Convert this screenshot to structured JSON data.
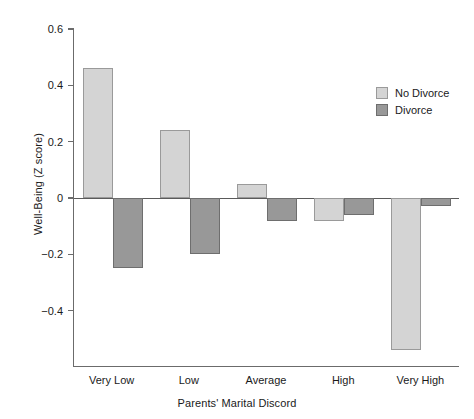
{
  "chart_data": {
    "type": "bar",
    "title": "",
    "xlabel": "Parents' Marital Discord",
    "ylabel": "Well-Being (Z score)",
    "categories": [
      "Very Low",
      "Low",
      "Average",
      "High",
      "Very High"
    ],
    "series": [
      {
        "name": "No Divorce",
        "color": "#d4d4d4",
        "values": [
          0.46,
          0.24,
          0.05,
          -0.08,
          -0.54
        ]
      },
      {
        "name": "Divorce",
        "color": "#989898",
        "values": [
          -0.25,
          -0.2,
          -0.08,
          -0.06,
          -0.03
        ]
      }
    ],
    "ylim": [
      -0.6,
      0.6
    ],
    "yticks": [
      0.6,
      0.4,
      0.2,
      0,
      -0.2,
      -0.4
    ],
    "ytick_labels": [
      "0.6",
      "0.4",
      "0.2",
      "0",
      "−0.2",
      "−0.4"
    ],
    "grid": false,
    "legend_position": "top-right"
  },
  "legend": {
    "items": [
      {
        "label": "No Divorce"
      },
      {
        "label": "Divorce"
      }
    ]
  }
}
